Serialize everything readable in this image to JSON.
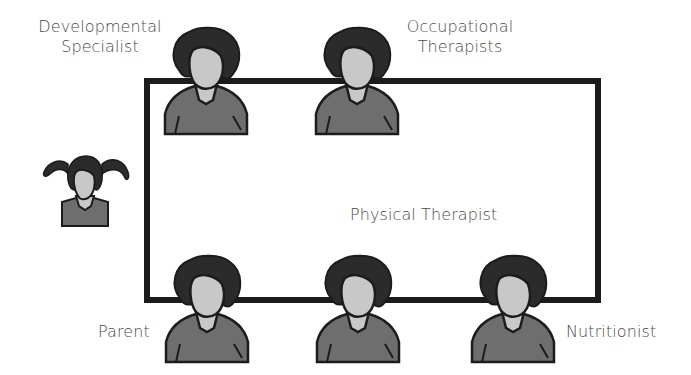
{
  "diagram": {
    "type": "team-meeting-seating",
    "labels": {
      "developmental_specialist": "Developmental\nSpecialist",
      "occupational_therapists": "Occupational\nTherapists",
      "physical_therapist": "Physical Therapist",
      "parent": "Parent",
      "nutritionist": "Nutritionist"
    },
    "participants": [
      {
        "role": "Developmental Specialist",
        "position": "top-left"
      },
      {
        "role": "Occupational Therapists",
        "position": "top-right"
      },
      {
        "role": "Parent",
        "position": "bottom-left"
      },
      {
        "role": "Physical Therapist",
        "position": "bottom-center"
      },
      {
        "role": "Nutritionist",
        "position": "bottom-right"
      },
      {
        "role": "Child",
        "position": "left-outside"
      }
    ],
    "colors": {
      "outline": "#1c1c1c",
      "hair": "#2b2b2b",
      "face": "#c8c8c8",
      "shirt": "#6e6e6e",
      "text": "#4a4a4a"
    }
  }
}
